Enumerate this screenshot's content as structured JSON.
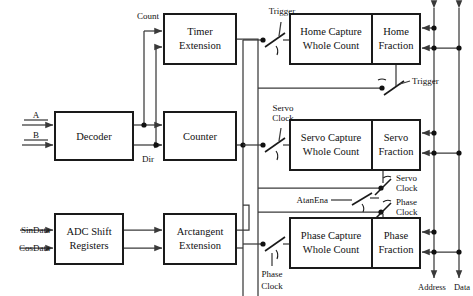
{
  "diagram": {
    "blocks": [
      {
        "id": "decoder",
        "label_lines": [
          "Decoder"
        ],
        "x": 55,
        "y": 112,
        "w": 78,
        "h": 48
      },
      {
        "id": "timer_ext",
        "label_lines": [
          "Timer",
          "Extension"
        ],
        "x": 164,
        "y": 14,
        "w": 72,
        "h": 50
      },
      {
        "id": "counter",
        "label_lines": [
          "Counter"
        ],
        "x": 164,
        "y": 112,
        "w": 72,
        "h": 48
      },
      {
        "id": "adc_shift",
        "label_lines": [
          "ADC Shift",
          "Registers"
        ],
        "x": 55,
        "y": 214,
        "w": 68,
        "h": 50
      },
      {
        "id": "arctan_ext",
        "label_lines": [
          "Arctangent",
          "Extension"
        ],
        "x": 164,
        "y": 214,
        "w": 72,
        "h": 50
      },
      {
        "id": "home_cap",
        "label_lines": [
          "Home Capture",
          "Whole Count"
        ],
        "x": 290,
        "y": 14,
        "w": 82,
        "h": 50
      },
      {
        "id": "home_frac",
        "label_lines": [
          "Home",
          "Fraction"
        ],
        "x": 372,
        "y": 14,
        "w": 48,
        "h": 50
      },
      {
        "id": "servo_cap",
        "label_lines": [
          "Servo Capture",
          "Whole Count"
        ],
        "x": 290,
        "y": 120,
        "w": 82,
        "h": 50
      },
      {
        "id": "servo_frac",
        "label_lines": [
          "Servo",
          "Fraction"
        ],
        "x": 372,
        "y": 120,
        "w": 48,
        "h": 50
      },
      {
        "id": "phase_cap",
        "label_lines": [
          "Phase Capture",
          "Whole Count"
        ],
        "x": 290,
        "y": 218,
        "w": 82,
        "h": 50
      },
      {
        "id": "phase_frac",
        "label_lines": [
          "Phase",
          "Fraction"
        ],
        "x": 372,
        "y": 218,
        "w": 48,
        "h": 50
      }
    ],
    "signals": {
      "input_a": "A",
      "input_b": "B",
      "input_sindata": "SinData",
      "input_cosdata": "CosData",
      "count": "Count",
      "dir": "Dir",
      "trigger_top": "Trigger",
      "trigger_mid": "Trigger",
      "servo_clock_top": "Servo",
      "servo_clock_top2": "Clock",
      "servo_clock_right": "Servo",
      "servo_clock_right2": "Clock",
      "phase_clock_right": "Phase",
      "phase_clock_right2": "Clock",
      "phase_clock_bottom": "Phase",
      "phase_clock_bottom2": "Clock",
      "atanena": "AtanEna",
      "bus_address": "Address",
      "bus_data": "Data"
    },
    "colors": {
      "block_border": "#1a1a1a",
      "wire": "#3a3a3a",
      "background": "#ffffff",
      "text": "#111111"
    }
  }
}
